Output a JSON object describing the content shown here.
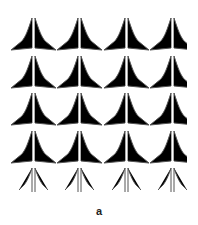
{
  "figure": {
    "panel_label": "a",
    "grid": {
      "columns": 4,
      "rows": 5,
      "column_centers": [
        34,
        80,
        127,
        173
      ],
      "row_tops": [
        18,
        56,
        93,
        131,
        168
      ],
      "clip_right": 187
    },
    "glyph": {
      "name": "arrowhead-glyph",
      "stroke_color": "#555555"
    }
  }
}
